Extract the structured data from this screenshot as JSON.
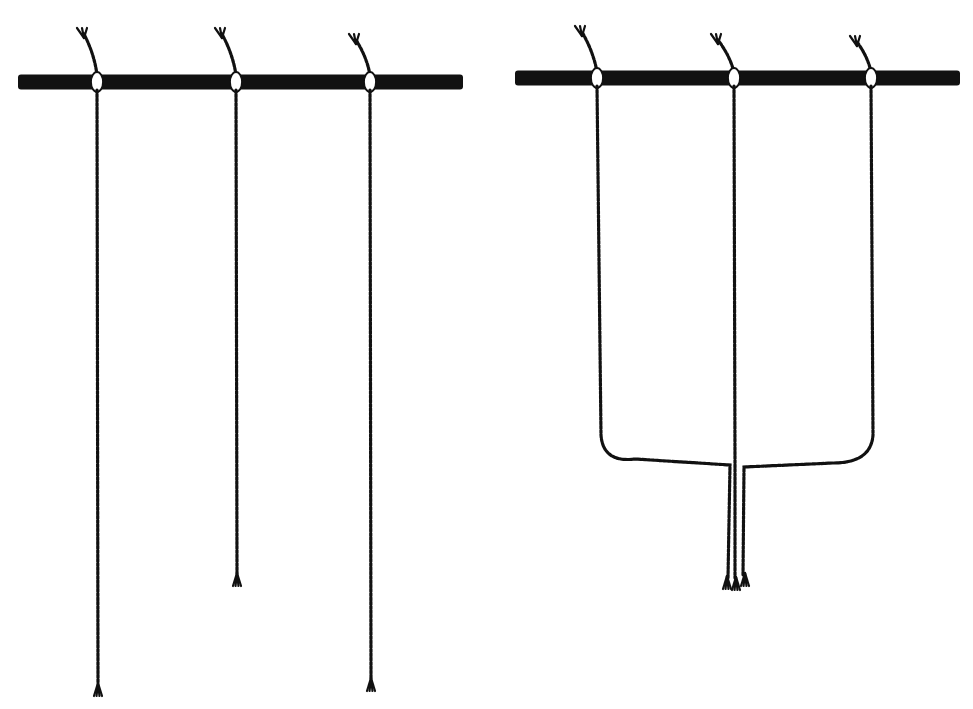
{
  "figure": {
    "colors": {
      "ink": "#111111",
      "background": "#ffffff"
    }
  },
  "panels": [
    {
      "id": "left",
      "rod": {
        "x1": 18,
        "x2": 463,
        "y": 82,
        "thickness": 15
      },
      "cords": [
        {
          "x": 97,
          "top_tail": [
            [
              97,
              75
            ],
            [
              84,
              34
            ]
          ],
          "end_y": 685,
          "tassel": true
        },
        {
          "x": 236,
          "top_tail": [
            [
              236,
              75
            ],
            [
              222,
              34
            ]
          ],
          "end_y": 575,
          "tassel": true
        },
        {
          "x": 370,
          "top_tail": [
            [
              370,
              75
            ],
            [
              356,
              40
            ]
          ],
          "end_y": 680,
          "tassel": true
        }
      ]
    },
    {
      "id": "right",
      "rod": {
        "x1": 515,
        "x2": 960,
        "y": 78,
        "thickness": 15
      },
      "cords": [
        {
          "x": 597,
          "top_tail": [
            [
              597,
              72
            ],
            [
              582,
              32
            ]
          ]
        },
        {
          "x": 734,
          "top_tail": [
            [
              734,
              72
            ],
            [
              718,
              40
            ]
          ]
        },
        {
          "x": 871,
          "top_tail": [
            [
              871,
              72
            ],
            [
              857,
              42
            ]
          ]
        }
      ],
      "gather": {
        "y": 463,
        "corner_r": 28,
        "center_x": 736,
        "end_y": 578
      }
    }
  ]
}
